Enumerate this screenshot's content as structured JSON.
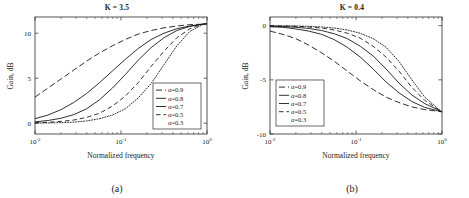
{
  "figure": {
    "panels": [
      {
        "caption": "(a)",
        "title": "K = 3.5",
        "xlabel": "Normalized frequency",
        "ylabel": "Gain, dB"
      },
      {
        "caption": "(b)",
        "title": "K = 0.4",
        "xlabel": "Normalized frequency",
        "ylabel": "Gain, dB"
      }
    ]
  },
  "chart_data": [
    {
      "type": "line",
      "title": "K = 3.5",
      "xlabel": "Normalized frequency",
      "ylabel": "Gain, dB",
      "xscale": "log",
      "xlim": [
        0.01,
        1.0
      ],
      "ylim": [
        -1.2,
        11.8
      ],
      "xticks": [
        0.01,
        0.1,
        1.0
      ],
      "xticklabels": [
        "10-2",
        "10-1",
        "100"
      ],
      "xtick_mantissa": [
        "10",
        "10",
        "10"
      ],
      "xtick_exponent": [
        "-2",
        "-1",
        "0"
      ],
      "yticks": [
        0,
        5,
        10
      ],
      "yticklabels": [
        "0",
        "5",
        "10"
      ],
      "grid": false,
      "legend_position": "lower right",
      "legend_entries": [
        "α=0.9",
        "α=0.8",
        "α=0.7",
        "α=0.5",
        "α=0.3"
      ],
      "legend_styles": [
        "dashed",
        "solid-light",
        "solid",
        "dashed-light",
        "dotted"
      ],
      "x": [
        0.01,
        0.0141,
        0.02,
        0.0282,
        0.0398,
        0.0562,
        0.0794,
        0.1122,
        0.1585,
        0.2239,
        0.3162,
        0.4467,
        0.631,
        0.8913,
        1.0
      ],
      "series": [
        {
          "name": "α=0.9",
          "style": "dashed",
          "values": [
            2.9,
            3.9,
            4.9,
            5.9,
            6.9,
            7.8,
            8.6,
            9.3,
            9.9,
            10.3,
            10.6,
            10.8,
            10.95,
            11.0,
            11.05
          ]
        },
        {
          "name": "α=0.8",
          "style": "solid-light",
          "values": [
            0.5,
            0.9,
            1.5,
            2.3,
            3.3,
            4.5,
            5.8,
            7.1,
            8.3,
            9.3,
            10.0,
            10.5,
            10.8,
            11.0,
            11.05
          ]
        },
        {
          "name": "α=0.7",
          "style": "solid",
          "values": [
            0.15,
            0.3,
            0.55,
            0.95,
            1.6,
            2.6,
            3.9,
            5.4,
            7.0,
            8.4,
            9.5,
            10.3,
            10.75,
            11.0,
            11.05
          ]
        },
        {
          "name": "α=0.5",
          "style": "dashed-light",
          "values": [
            0.05,
            0.1,
            0.2,
            0.35,
            0.65,
            1.1,
            1.9,
            3.0,
            4.5,
            6.3,
            8.0,
            9.5,
            10.5,
            11.0,
            11.05
          ]
        },
        {
          "name": "α=0.3",
          "style": "dotted",
          "values": [
            0.02,
            0.03,
            0.06,
            0.12,
            0.25,
            0.5,
            0.9,
            1.6,
            2.8,
            4.4,
            6.5,
            8.6,
            10.2,
            10.95,
            11.05
          ]
        }
      ]
    },
    {
      "type": "line",
      "title": "K = 0.4",
      "xlabel": "Normalized frequency",
      "ylabel": "Gain, dB",
      "xscale": "log",
      "xlim": [
        0.01,
        1.0
      ],
      "ylim": [
        -10,
        0.8
      ],
      "xticks": [
        0.01,
        0.1,
        1.0
      ],
      "xticklabels": [
        "10-2",
        "10-1",
        "100"
      ],
      "xtick_mantissa": [
        "10",
        "10",
        "10"
      ],
      "xtick_exponent": [
        "-2",
        "-1",
        "0"
      ],
      "yticks": [
        0,
        -5,
        -10
      ],
      "yticklabels": [
        "0",
        "-5",
        "-10"
      ],
      "grid": false,
      "legend_position": "lower left",
      "legend_entries": [
        "α=0.9",
        "α=0.8",
        "α=0.7",
        "α=0.5",
        "α=0.3"
      ],
      "legend_styles": [
        "dashed",
        "solid-light",
        "solid",
        "dashed-light",
        "dotted"
      ],
      "x": [
        0.01,
        0.0141,
        0.02,
        0.0282,
        0.0398,
        0.0562,
        0.0794,
        0.1122,
        0.1585,
        0.2239,
        0.3162,
        0.4467,
        0.631,
        0.8913,
        1.0
      ],
      "series": [
        {
          "name": "α=0.9",
          "style": "dashed",
          "values": [
            -0.5,
            -0.8,
            -1.2,
            -1.8,
            -2.5,
            -3.3,
            -4.2,
            -5.1,
            -5.9,
            -6.6,
            -7.1,
            -7.5,
            -7.75,
            -7.9,
            -7.95
          ]
        },
        {
          "name": "α=0.8",
          "style": "solid-light",
          "values": [
            -0.1,
            -0.15,
            -0.3,
            -0.5,
            -0.8,
            -1.3,
            -2.0,
            -2.9,
            -4.0,
            -5.2,
            -6.2,
            -7.0,
            -7.55,
            -7.85,
            -7.95
          ]
        },
        {
          "name": "α=0.7",
          "style": "solid",
          "values": [
            -0.05,
            -0.08,
            -0.15,
            -0.25,
            -0.45,
            -0.75,
            -1.2,
            -1.9,
            -2.8,
            -4.0,
            -5.3,
            -6.4,
            -7.2,
            -7.75,
            -7.95
          ]
        },
        {
          "name": "α=0.5",
          "style": "dashed-light",
          "values": [
            -0.02,
            -0.03,
            -0.06,
            -0.12,
            -0.22,
            -0.4,
            -0.7,
            -1.15,
            -1.9,
            -2.9,
            -4.2,
            -5.7,
            -6.9,
            -7.7,
            -7.95
          ]
        },
        {
          "name": "α=0.3",
          "style": "dotted",
          "values": [
            -0.01,
            -0.02,
            -0.03,
            -0.06,
            -0.12,
            -0.22,
            -0.4,
            -0.7,
            -1.2,
            -2.0,
            -3.3,
            -5.0,
            -6.6,
            -7.65,
            -7.95
          ]
        }
      ]
    }
  ]
}
